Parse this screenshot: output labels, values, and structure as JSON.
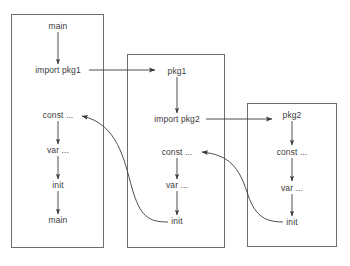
{
  "diagram": {
    "type": "package-initialization-order",
    "caption": "",
    "background_color": "#ffffff",
    "box_border_color": "#6e6e6e",
    "arrow_color": "#3a3a3a",
    "text_color": "#3d3d3d",
    "packages": [
      {
        "id": "main-package",
        "box": {
          "x": 11,
          "y": 14,
          "width": 93,
          "height": 234
        },
        "center_x": 58,
        "nodes": [
          {
            "id": "main-entry",
            "label": "main",
            "x": 58,
            "y": 26
          },
          {
            "id": "main-import-pkg1",
            "label": "import pkg1",
            "x": 58,
            "y": 70
          },
          {
            "id": "main-const",
            "label": "const ...",
            "x": 58,
            "y": 115
          },
          {
            "id": "main-var",
            "label": "var ...",
            "x": 58,
            "y": 150
          },
          {
            "id": "main-init",
            "label": "init",
            "x": 58,
            "y": 185
          },
          {
            "id": "main-func-main",
            "label": "main",
            "x": 58,
            "y": 220
          }
        ],
        "vertical_arrows": [
          {
            "from_y": 32,
            "to_y": 64
          },
          {
            "from_y": 121,
            "to_y": 144
          },
          {
            "from_y": 156,
            "to_y": 179
          },
          {
            "from_y": 191,
            "to_y": 214
          }
        ]
      },
      {
        "id": "pkg1-package",
        "box": {
          "x": 127,
          "y": 54,
          "width": 98,
          "height": 194
        },
        "center_x": 177,
        "nodes": [
          {
            "id": "pkg1-name",
            "label": "pkg1",
            "x": 177,
            "y": 71
          },
          {
            "id": "pkg1-import-pkg2",
            "label": "import pkg2",
            "x": 177,
            "y": 119
          },
          {
            "id": "pkg1-const",
            "label": "const ...",
            "x": 177,
            "y": 152
          },
          {
            "id": "pkg1-var",
            "label": "var ...",
            "x": 177,
            "y": 185
          },
          {
            "id": "pkg1-init",
            "label": "init",
            "x": 177,
            "y": 221
          }
        ],
        "vertical_arrows": [
          {
            "from_y": 77,
            "to_y": 113
          },
          {
            "from_y": 158,
            "to_y": 179
          },
          {
            "from_y": 191,
            "to_y": 215
          }
        ]
      },
      {
        "id": "pkg2-package",
        "box": {
          "x": 247,
          "y": 103,
          "width": 90,
          "height": 144
        },
        "center_x": 292,
        "nodes": [
          {
            "id": "pkg2-name",
            "label": "pkg2",
            "x": 292,
            "y": 115
          },
          {
            "id": "pkg2-const",
            "label": "const ...",
            "x": 292,
            "y": 152
          },
          {
            "id": "pkg2-var",
            "label": "var ...",
            "x": 292,
            "y": 188
          },
          {
            "id": "pkg2-init",
            "label": "init",
            "x": 292,
            "y": 222
          }
        ],
        "vertical_arrows": [
          {
            "from_y": 121,
            "to_y": 145
          },
          {
            "from_y": 158,
            "to_y": 181
          },
          {
            "from_y": 194,
            "to_y": 216
          }
        ]
      }
    ],
    "import_arrows": [
      {
        "id": "import-main-to-pkg1",
        "from": "main-import-pkg1",
        "to": "pkg1-name",
        "x1": 89,
        "y1": 70,
        "x2": 155,
        "y2": 70
      },
      {
        "id": "import-pkg1-to-pkg2",
        "from": "pkg1-import-pkg2",
        "to": "pkg2-name",
        "x1": 206,
        "y1": 119,
        "x2": 272,
        "y2": 119
      }
    ],
    "return_arrows": [
      {
        "id": "return-pkg1-init-to-main-const",
        "from": "pkg1-init",
        "to": "main-const",
        "path": "M 168 222 C 148 222 140 216 132 188 C 124 160 118 124 82 116"
      },
      {
        "id": "return-pkg2-init-to-pkg1-const",
        "from": "pkg2-init",
        "to": "pkg1-const",
        "path": "M 283 222 C 263 222 254 214 247 192 C 239 168 230 155 202 152"
      }
    ]
  }
}
